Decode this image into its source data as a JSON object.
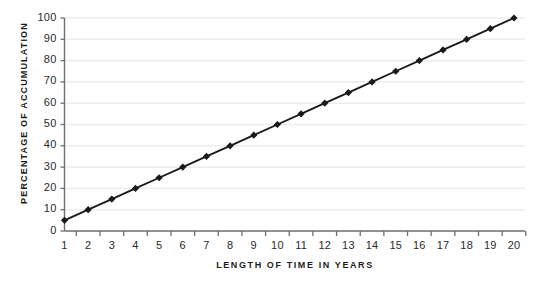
{
  "chart_data": {
    "type": "line",
    "title": "",
    "subtitle": "",
    "xlabel": "LENGTH OF TIME IN YEARS",
    "ylabel": "PERCENTAGE OF ACCUMULATION",
    "x": [
      1,
      2,
      3,
      4,
      5,
      6,
      7,
      8,
      9,
      10,
      11,
      12,
      13,
      14,
      15,
      16,
      17,
      18,
      19,
      20
    ],
    "values": [
      5,
      10,
      15,
      20,
      25,
      30,
      35,
      40,
      45,
      50,
      55,
      60,
      65,
      70,
      75,
      80,
      85,
      90,
      95,
      100
    ],
    "series": [
      {
        "name": "Percentage of Accumulation",
        "values": [
          5,
          10,
          15,
          20,
          25,
          30,
          35,
          40,
          45,
          50,
          55,
          60,
          65,
          70,
          75,
          80,
          85,
          90,
          95,
          100
        ]
      }
    ],
    "xtick_labels": [
      "1",
      "2",
      "3",
      "4",
      "5",
      "6",
      "7",
      "8",
      "9",
      "10",
      "11",
      "12",
      "13",
      "14",
      "15",
      "16",
      "17",
      "18",
      "19",
      "20"
    ],
    "ytick_labels": [
      "0",
      "10",
      "20",
      "30",
      "40",
      "50",
      "60",
      "70",
      "80",
      "90",
      "100"
    ],
    "ytick_values": [
      0,
      10,
      20,
      30,
      40,
      50,
      60,
      70,
      80,
      90,
      100
    ],
    "xlim": [
      1,
      20
    ],
    "ylim": [
      0,
      100
    ],
    "grid": "horizontal",
    "legend": "none",
    "marker": "diamond",
    "line_color": "#1a1a1a",
    "marker_color": "#1a1a1a",
    "grid_color": "#ededf0",
    "axis_color": "#6e6e73",
    "text_color": "#1c1c1c",
    "background": "#ffffff",
    "annotations": []
  }
}
